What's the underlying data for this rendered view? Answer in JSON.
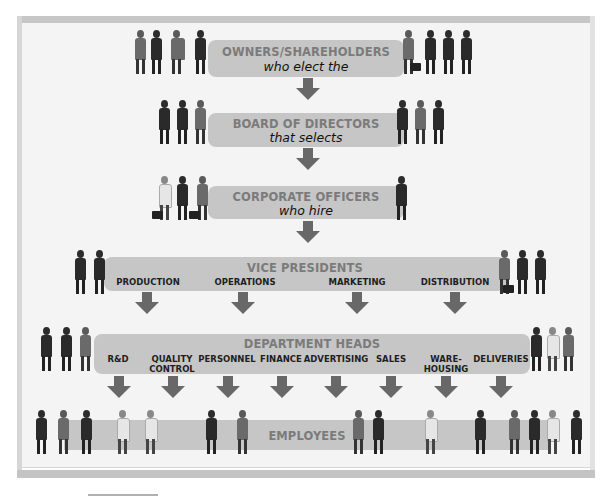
{
  "diagram": {
    "type": "organizational-hierarchy",
    "levels": [
      {
        "id": "owners",
        "title": "OWNERS/SHAREHOLDERS",
        "subtitle": "who elect the"
      },
      {
        "id": "board",
        "title": "BOARD OF DIRECTORS",
        "subtitle": "that selects"
      },
      {
        "id": "officers",
        "title": "CORPORATE OFFICERS",
        "subtitle": "who hire"
      },
      {
        "id": "vp",
        "title": "VICE PRESIDENTS",
        "divisions": [
          "PRODUCTION",
          "OPERATIONS",
          "MARKETING",
          "DISTRIBUTION"
        ]
      },
      {
        "id": "dept",
        "title": "DEPARTMENT HEADS",
        "divisions": [
          "R&D",
          "QUALITY\nCONTROL",
          "PERSONNEL",
          "FINANCE",
          "ADVERTISING",
          "SALES",
          "WARE-\nHOUSING",
          "DELIVERIES"
        ]
      },
      {
        "id": "employees",
        "title": "EMPLOYEES"
      }
    ],
    "colors": {
      "panel": "#f4f4f4",
      "frame": "#c7c7c7",
      "banner": "#c6c6c6",
      "banner_title": "#7b7b7b",
      "arrow": "#686868",
      "label": "#1e1e1e"
    }
  }
}
